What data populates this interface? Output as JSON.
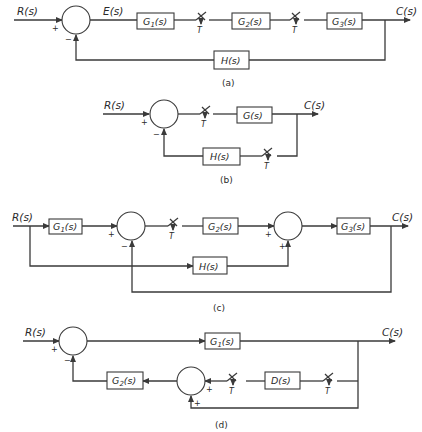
{
  "figure": {
    "panels": [
      {
        "id": "a",
        "caption": "(a)",
        "input_label": "R(s)",
        "error_label": "E(s)",
        "output_label": "C(s)",
        "blocks": [
          "G1(s)",
          "G2(s)",
          "G3(s)",
          "H(s)"
        ],
        "samplers": [
          "T",
          "T"
        ],
        "summing_junction_signs": [
          "+",
          "−"
        ]
      },
      {
        "id": "b",
        "caption": "(b)",
        "input_label": "R(s)",
        "output_label": "C(s)",
        "blocks": [
          "G(s)",
          "H(s)"
        ],
        "samplers": [
          "T",
          "T"
        ],
        "summing_junction_signs": [
          "+",
          "−"
        ]
      },
      {
        "id": "c",
        "caption": "(c)",
        "input_label": "R(s)",
        "output_label": "C(s)",
        "blocks": [
          "G1(s)",
          "G2(s)",
          "G3(s)",
          "H(s)"
        ],
        "samplers": [
          "T"
        ],
        "summing_junction_1_signs": [
          "+",
          "−"
        ],
        "summing_junction_2_signs": [
          "+",
          "+"
        ]
      },
      {
        "id": "d",
        "caption": "(d)",
        "input_label": "R(s)",
        "output_label": "C(s)",
        "blocks": [
          "G1(s)",
          "G2(s)",
          "D(s)"
        ],
        "samplers": [
          "T",
          "T"
        ],
        "summing_junction_1_signs": [
          "+",
          "−"
        ],
        "summing_junction_2_signs": [
          "+",
          "+"
        ]
      }
    ]
  },
  "a": {
    "R": "R(s)",
    "E": "E(s)",
    "C": "C(s)",
    "G1": "G",
    "G1sub": "1",
    "G2": "G",
    "G2sub": "2",
    "G3": "G",
    "G3sub": "3",
    "s": "(s)",
    "H": "H(s)",
    "T": "T",
    "plus": "+",
    "minus": "−",
    "cap": "(a)"
  },
  "b": {
    "R": "R(s)",
    "C": "C(s)",
    "G": "G(s)",
    "H": "H(s)",
    "T": "T",
    "plus": "+",
    "minus": "−",
    "cap": "(b)"
  },
  "c": {
    "R": "R(s)",
    "C": "C(s)",
    "G1": "G",
    "G1sub": "1",
    "G2": "G",
    "G2sub": "2",
    "G3": "G",
    "G3sub": "3",
    "s": "(s)",
    "H": "H(s)",
    "T": "T",
    "plus": "+",
    "minus": "−",
    "cap": "(c)"
  },
  "d": {
    "R": "R(s)",
    "C": "C(s)",
    "G1": "G",
    "G1sub": "1",
    "G2": "G",
    "G2sub": "2",
    "s": "(s)",
    "D": "D(s)",
    "T": "T",
    "plus": "+",
    "minus": "−",
    "cap": "(d)"
  }
}
